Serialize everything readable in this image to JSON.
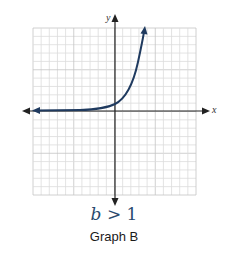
{
  "chart_data": {
    "type": "line",
    "title": "Graph B",
    "subtitle": "b > 1",
    "xlabel": "x",
    "ylabel": "y",
    "xlim": [
      -10,
      10
    ],
    "ylim": [
      -10,
      10
    ],
    "grid": true,
    "grid_divisions": 20,
    "legend": null,
    "series": [
      {
        "name": "exponential growth y = b^x (b > 1)",
        "color": "#1f3a5f",
        "x": [
          -10,
          -8,
          -6,
          -4,
          -2,
          -1,
          0,
          1,
          2,
          3,
          3.6
        ],
        "y": [
          0.0,
          0.0,
          0.05,
          0.1,
          0.3,
          0.5,
          1.0,
          2.0,
          4.0,
          7.5,
          10
        ]
      }
    ]
  },
  "caption": {
    "condition_var": "b",
    "condition_rest": " > 1",
    "graph_label": "Graph B"
  },
  "axes": {
    "x_label": "x",
    "y_label": "y"
  },
  "colors": {
    "curve": "#1f3a5f",
    "grid_minor": "#dcdcdc",
    "grid_major": "#c4c4c4",
    "axis": "#222222"
  }
}
